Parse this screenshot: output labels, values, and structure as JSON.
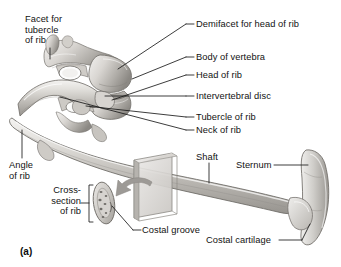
{
  "figure": {
    "panel_id": "(a)"
  },
  "labels": {
    "facet_for_tubercle_of_rib": "Facet for\ntubercle\nof rib",
    "demifacet_for_head_of_rib": "Demifacet for head of rib",
    "body_of_vertebra": "Body of vertebra",
    "head_of_rib": "Head of rib",
    "intervertebral_disc": "Intervertebral disc",
    "tubercle_of_rib": "Tubercle of rib",
    "neck_of_rib": "Neck of rib",
    "angle_of_rib": "Angle\nof rib",
    "cross_section_of_rib": "Cross-\nsection\nof rib",
    "shaft": "Shaft",
    "sternum": "Sternum",
    "costal_groove": "Costal groove",
    "costal_cartilage": "Costal cartilage"
  },
  "colors": {
    "background": "#ffffff",
    "text": "#121212",
    "leader_line": "#1a1a1a",
    "bone_light": "#e9e7e4",
    "bone_mid": "#c3c0bb",
    "bone_dark": "#8d8a85",
    "bone_shadow": "#6a6762",
    "plane_face": "#dcdad7",
    "plane_side": "#b6b3ae",
    "arrow": "#9b9894"
  },
  "structures": [
    {
      "name": "thoracic-vertebrae",
      "description": "Two stacked thoracic vertebrae shown in lateral oblique view"
    },
    {
      "name": "rib-shaft",
      "description": "Long curved rib sweeping from vertebrae to sternum"
    },
    {
      "name": "sternum",
      "description": "Vertical breastbone at the right edge"
    },
    {
      "name": "costal-cartilage",
      "description": "Cartilage joining the rib to the sternum"
    },
    {
      "name": "cross-section-oval",
      "description": "Oval cross-section of rib with costal groove"
    },
    {
      "name": "sectioning-plane",
      "description": "Transparent rectangular cutting plane through the rib shaft"
    },
    {
      "name": "section-arrow",
      "description": "Curved arrow pointing from the plane to the cross-section"
    }
  ]
}
